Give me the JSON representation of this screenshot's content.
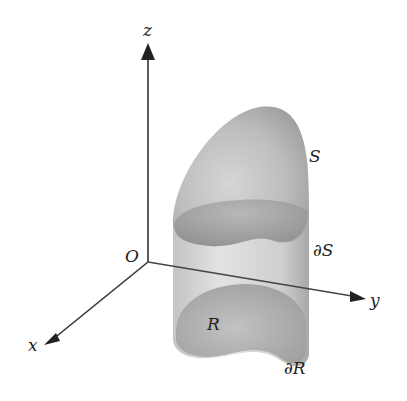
{
  "figure": {
    "axes": {
      "z_label": "z",
      "y_label": "y",
      "x_label": "x",
      "origin_label": "O"
    },
    "labels": {
      "surface": "S",
      "surface_boundary": "∂S",
      "region": "R",
      "region_boundary": "∂R"
    },
    "colors": {
      "axis": "#333333",
      "surface_light": "#d4d4d4",
      "surface_dark": "#8e8e8e",
      "cylinder_light": "#dcdcdc",
      "cylinder_dark": "#a8a8a8",
      "region": "#b5b5b5"
    }
  }
}
